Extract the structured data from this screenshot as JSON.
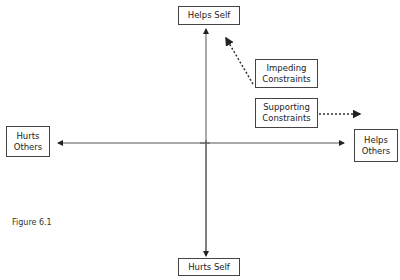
{
  "diagram": {
    "figure_label": "Figure 6.1",
    "axes": {
      "top": "Helps Self",
      "bottom": "Hurts Self",
      "left": "Hurts Others",
      "right": "Helps Others"
    },
    "constraints": [
      {
        "label": "Impeding Constraints",
        "line1": "Impeding",
        "line2": "Constraints",
        "arrow_direction": "up-left toward Helps Self",
        "style": "dotted"
      },
      {
        "label": "Supporting Constraints",
        "line1": "Supporting",
        "line2": "Constraints",
        "arrow_direction": "right toward Helps Others",
        "style": "dotted"
      }
    ],
    "colors": {
      "line": "#444444",
      "background": "#ffffff"
    }
  }
}
